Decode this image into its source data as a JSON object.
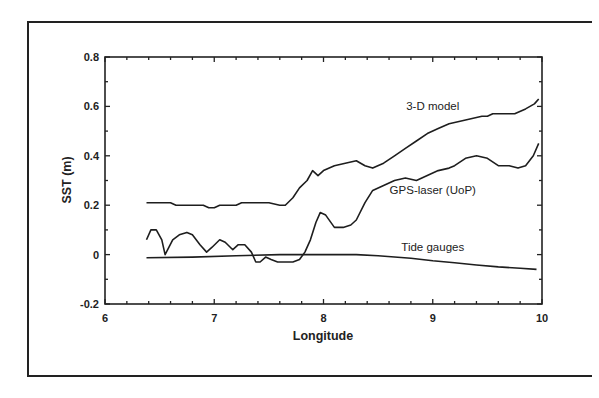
{
  "chart_data": {
    "type": "line",
    "title": "",
    "xlabel": "Longitude",
    "ylabel": "SST (m)",
    "xlim": [
      6,
      10
    ],
    "ylim": [
      -0.2,
      0.8
    ],
    "xticks": [
      6,
      7,
      8,
      9,
      10
    ],
    "xtick_labels": [
      "6",
      "7",
      "8",
      "9",
      "10"
    ],
    "yticks": [
      -0.2,
      0,
      0.2,
      0.4,
      0.6,
      0.8
    ],
    "ytick_labels": [
      "-0.2",
      "0",
      "0.2",
      "0.4",
      "0.6",
      "0.8"
    ],
    "grid": false,
    "legend": "inline labels next to curves",
    "series": [
      {
        "name": "3-D model",
        "label_pos": [
          9.0,
          0.585
        ],
        "x": [
          6.38,
          6.6,
          6.65,
          6.9,
          6.95,
          7.0,
          7.05,
          7.2,
          7.25,
          7.5,
          7.6,
          7.65,
          7.72,
          7.78,
          7.85,
          7.9,
          7.95,
          8.0,
          8.1,
          8.2,
          8.3,
          8.38,
          8.45,
          8.55,
          8.65,
          8.75,
          8.85,
          8.95,
          9.05,
          9.15,
          9.25,
          9.35,
          9.45,
          9.5,
          9.55,
          9.75,
          9.85,
          9.93,
          9.97
        ],
        "y": [
          0.21,
          0.21,
          0.2,
          0.2,
          0.19,
          0.19,
          0.2,
          0.2,
          0.21,
          0.21,
          0.2,
          0.2,
          0.23,
          0.27,
          0.3,
          0.34,
          0.32,
          0.34,
          0.36,
          0.37,
          0.38,
          0.36,
          0.35,
          0.37,
          0.4,
          0.43,
          0.46,
          0.49,
          0.51,
          0.53,
          0.54,
          0.55,
          0.56,
          0.56,
          0.57,
          0.57,
          0.59,
          0.61,
          0.63
        ]
      },
      {
        "name": "GPS-laser (UoP)",
        "label_pos": [
          9.0,
          0.245
        ],
        "x": [
          6.38,
          6.42,
          6.47,
          6.52,
          6.55,
          6.62,
          6.68,
          6.75,
          6.8,
          6.87,
          6.93,
          6.98,
          7.05,
          7.1,
          7.17,
          7.22,
          7.28,
          7.34,
          7.38,
          7.42,
          7.47,
          7.52,
          7.58,
          7.65,
          7.72,
          7.78,
          7.83,
          7.88,
          7.93,
          7.97,
          8.02,
          8.1,
          8.18,
          8.25,
          8.3,
          8.38,
          8.45,
          8.55,
          8.65,
          8.75,
          8.85,
          8.95,
          9.05,
          9.15,
          9.2,
          9.3,
          9.4,
          9.5,
          9.6,
          9.7,
          9.78,
          9.85,
          9.92,
          9.97
        ],
        "y": [
          0.06,
          0.1,
          0.1,
          0.06,
          0.0,
          0.06,
          0.08,
          0.09,
          0.08,
          0.04,
          0.01,
          0.03,
          0.06,
          0.05,
          0.02,
          0.04,
          0.04,
          0.01,
          -0.03,
          -0.03,
          -0.01,
          -0.02,
          -0.03,
          -0.03,
          -0.03,
          -0.02,
          0.01,
          0.06,
          0.13,
          0.17,
          0.16,
          0.11,
          0.11,
          0.12,
          0.14,
          0.21,
          0.26,
          0.28,
          0.3,
          0.31,
          0.3,
          0.32,
          0.34,
          0.35,
          0.36,
          0.39,
          0.4,
          0.39,
          0.36,
          0.36,
          0.35,
          0.36,
          0.4,
          0.45
        ]
      },
      {
        "name": "Tide gauges",
        "label_pos": [
          9.0,
          0.015
        ],
        "x": [
          6.38,
          6.8,
          7.2,
          7.6,
          8.0,
          8.3,
          8.5,
          8.8,
          9.0,
          9.2,
          9.4,
          9.6,
          9.8,
          9.95
        ],
        "y": [
          -0.013,
          -0.01,
          -0.005,
          0.0,
          0.0,
          0.0,
          -0.005,
          -0.015,
          -0.025,
          -0.033,
          -0.042,
          -0.05,
          -0.055,
          -0.06
        ]
      }
    ]
  }
}
